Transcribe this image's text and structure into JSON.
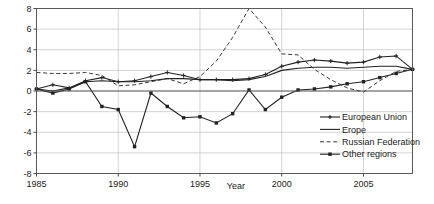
{
  "chart_data": {
    "type": "line",
    "title": "",
    "xlabel": "Year",
    "ylabel": "",
    "xlim": [
      1985,
      2008
    ],
    "ylim": [
      -8,
      8
    ],
    "xticks": [
      1985,
      1990,
      1995,
      2000,
      2005
    ],
    "yticks": [
      8,
      6,
      4,
      2,
      0,
      -2,
      -4,
      -6,
      -8
    ],
    "grid": true,
    "legend_position": "lower-right",
    "x": [
      1985,
      1986,
      1987,
      1988,
      1989,
      1990,
      1991,
      1992,
      1993,
      1994,
      1995,
      1996,
      1997,
      1998,
      1999,
      2000,
      2001,
      2002,
      2003,
      2004,
      2005,
      2006,
      2007,
      2008
    ],
    "series": [
      {
        "name": "European Union",
        "style": "solid-with-markers",
        "marker": "small-plus",
        "color": "#222222",
        "values": [
          0.2,
          0.6,
          0.3,
          1.0,
          1.3,
          0.9,
          1.0,
          1.4,
          1.8,
          1.5,
          1.1,
          1.1,
          1.1,
          1.2,
          1.6,
          2.4,
          2.8,
          3.0,
          2.9,
          2.7,
          2.8,
          3.3,
          3.4,
          2.1
        ]
      },
      {
        "name": "Erope",
        "style": "solid",
        "marker": "none",
        "color": "#222222",
        "values": [
          0.2,
          0.0,
          0.3,
          0.9,
          1.0,
          0.9,
          0.9,
          1.0,
          1.2,
          1.2,
          1.1,
          1.1,
          1.0,
          1.1,
          1.4,
          2.0,
          2.2,
          2.3,
          2.3,
          2.2,
          2.3,
          2.4,
          2.4,
          2.1
        ]
      },
      {
        "name": "Russian Federation",
        "style": "dashed",
        "marker": "none",
        "color": "#222222",
        "values": [
          1.8,
          1.7,
          1.7,
          1.8,
          1.5,
          0.5,
          0.6,
          0.9,
          1.2,
          0.7,
          1.4,
          2.9,
          5.2,
          8.0,
          6.2,
          3.6,
          3.5,
          2.1,
          1.1,
          0.3,
          -0.1,
          1.0,
          1.9,
          2.1
        ]
      },
      {
        "name": "Other regions",
        "style": "solid-with-markers",
        "marker": "filled-square",
        "color": "#222222",
        "values": [
          0.2,
          -0.2,
          0.2,
          0.9,
          -1.5,
          -1.8,
          -5.4,
          -0.2,
          -1.5,
          -2.6,
          -2.5,
          -3.1,
          -2.2,
          0.1,
          -1.8,
          -0.6,
          0.1,
          0.2,
          0.4,
          0.7,
          0.9,
          1.3,
          1.7,
          2.1
        ]
      }
    ]
  },
  "legend": {
    "items": [
      {
        "label": "European Union",
        "style": "solid-with-markers"
      },
      {
        "label": "Erope",
        "style": "solid"
      },
      {
        "label": "Russian Federation",
        "style": "dashed"
      },
      {
        "label": "Other regions",
        "style": "solid-with-markers"
      }
    ]
  }
}
